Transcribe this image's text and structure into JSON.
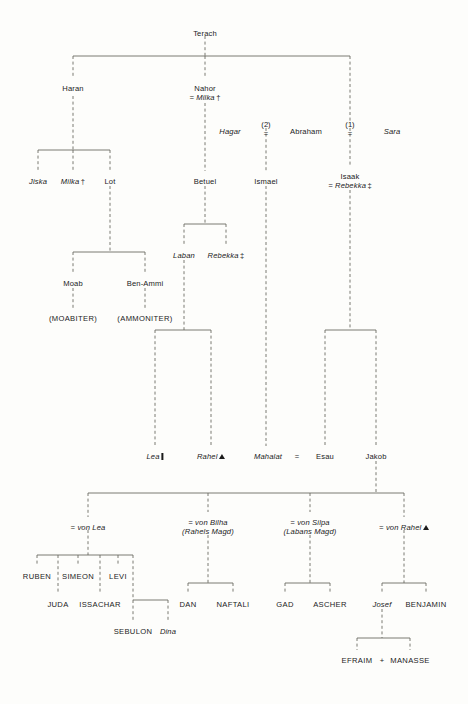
{
  "diagram": {
    "type": "genealogy",
    "background_color": "#fdfdfb",
    "line_color": "#6b6b63",
    "text_color": "#1b1b1b",
    "legend_marks": {
      "dagger": "†",
      "double_dagger": "‡",
      "bar": "bar-marker",
      "triangle": "triangle-marker"
    }
  },
  "nodes": {
    "terach": {
      "label": "Terach",
      "x": 205,
      "y": 30,
      "style": "roman"
    },
    "haran": {
      "label": "Haran",
      "x": 73,
      "y": 85,
      "style": "roman"
    },
    "nahor": {
      "label": "Nahor",
      "x": 205,
      "y": 85,
      "style": "roman",
      "spouse": "= Milka",
      "spouse_mark": "dagger"
    },
    "hagar": {
      "label": "Hagar",
      "x": 230,
      "y": 128,
      "style": "italic"
    },
    "abraham": {
      "label": "Abraham",
      "x": 306,
      "y": 128,
      "style": "roman"
    },
    "sara": {
      "label": "Sara",
      "x": 392,
      "y": 128,
      "style": "italic"
    },
    "marriage2": {
      "label": "(2)",
      "eq": "=",
      "x": 266,
      "y": 120
    },
    "marriage1": {
      "label": "(1)",
      "eq": "=",
      "x": 350,
      "y": 120
    },
    "jiska": {
      "label": "Jiska",
      "x": 38,
      "y": 178,
      "style": "italic"
    },
    "milka": {
      "label": "Milka",
      "x": 73,
      "y": 178,
      "style": "italic",
      "mark": "dagger"
    },
    "lot": {
      "label": "Lot",
      "x": 110,
      "y": 178,
      "style": "roman"
    },
    "betuel": {
      "label": "Betuel",
      "x": 205,
      "y": 178,
      "style": "roman"
    },
    "ismael": {
      "label": "Ismael",
      "x": 266,
      "y": 178,
      "style": "roman"
    },
    "isaak": {
      "label": "Isaak",
      "x": 350,
      "y": 173,
      "style": "roman",
      "spouse": "= Rebekka",
      "spouse_mark": "double_dagger"
    },
    "laban": {
      "label": "Laban",
      "x": 184,
      "y": 252,
      "style": "italic"
    },
    "rebekka": {
      "label": "Rebekka",
      "x": 226,
      "y": 252,
      "style": "italic",
      "mark": "double_dagger"
    },
    "moab": {
      "label": "Moab",
      "x": 73,
      "y": 280,
      "style": "roman"
    },
    "benammi": {
      "label": "Ben-Ammi",
      "x": 145,
      "y": 280,
      "style": "roman"
    },
    "moabiter": {
      "label": "(MOABITER)",
      "x": 73,
      "y": 315,
      "style": "caps"
    },
    "ammoniter": {
      "label": "(AMMONITER)",
      "x": 145,
      "y": 315,
      "style": "caps"
    },
    "lea": {
      "label": "Lea",
      "x": 155,
      "y": 453,
      "style": "italic",
      "mark": "bar"
    },
    "rahel": {
      "label": "Rahel",
      "x": 211,
      "y": 453,
      "style": "italic",
      "mark": "triangle"
    },
    "mahalat": {
      "label": "Mahalat",
      "x": 268,
      "y": 453,
      "style": "italic"
    },
    "esau": {
      "label": "Esau",
      "x": 325,
      "y": 453,
      "style": "roman"
    },
    "jakob": {
      "label": "Jakob",
      "x": 376,
      "y": 453,
      "style": "roman"
    },
    "esau_marriage": {
      "label": "=",
      "x": 297,
      "y": 453
    },
    "von_lea": {
      "label": "= von Lea",
      "x": 88,
      "y": 524,
      "style": "italic"
    },
    "von_bilha": {
      "label": "= von Bilha",
      "sub": "(Rahels Magd)",
      "x": 208,
      "y": 519,
      "style": "italic"
    },
    "von_silpa": {
      "label": "= von Silpa",
      "sub": "(Labans Magd)",
      "x": 310,
      "y": 519,
      "style": "italic"
    },
    "von_rahel": {
      "label": "= von Rahel",
      "x": 404,
      "y": 524,
      "style": "italic",
      "mark": "triangle"
    },
    "ruben": {
      "label": "RUBEN",
      "x": 37,
      "y": 573,
      "style": "caps"
    },
    "simeon": {
      "label": "SIMEON",
      "x": 78,
      "y": 573,
      "style": "caps"
    },
    "levi": {
      "label": "LEVI",
      "x": 118,
      "y": 573,
      "style": "caps"
    },
    "juda": {
      "label": "JUDA",
      "x": 58,
      "y": 601,
      "style": "caps"
    },
    "issachar": {
      "label": "ISSACHAR",
      "x": 100,
      "y": 601,
      "style": "caps"
    },
    "sebulon": {
      "label": "SEBULON",
      "x": 133,
      "y": 628,
      "style": "caps"
    },
    "dina": {
      "label": "Dina",
      "x": 168,
      "y": 628,
      "style": "italic"
    },
    "dan": {
      "label": "DAN",
      "x": 188,
      "y": 601,
      "style": "caps"
    },
    "naftali": {
      "label": "NAFTALI",
      "x": 233,
      "y": 601,
      "style": "caps"
    },
    "gad": {
      "label": "GAD",
      "x": 285,
      "y": 601,
      "style": "caps"
    },
    "ascher": {
      "label": "ASCHER",
      "x": 330,
      "y": 601,
      "style": "caps"
    },
    "josef": {
      "label": "Josef",
      "x": 382,
      "y": 601,
      "style": "italic"
    },
    "benjamin": {
      "label": "BENJAMIN",
      "x": 426,
      "y": 601,
      "style": "caps"
    },
    "efraim": {
      "label": "EFRAIM",
      "x": 357,
      "y": 657,
      "style": "caps"
    },
    "plus": {
      "label": "+",
      "x": 382,
      "y": 657
    },
    "manasse": {
      "label": "MANASSE",
      "x": 410,
      "y": 657,
      "style": "caps"
    }
  }
}
